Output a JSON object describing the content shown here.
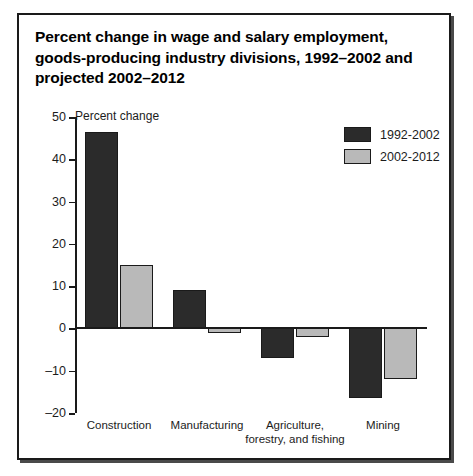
{
  "figure": {
    "title": "Percent change in wage and salary employment, goods-producing industry divisions, 1992–2002 and projected 2002–2012"
  },
  "chart_data": {
    "type": "bar",
    "title": "Percent change in wage and salary employment, goods-producing industry divisions, 1992–2002 and projected 2002–2012",
    "xlabel": "",
    "ylabel": "Percent change",
    "ylim": [
      -20,
      50
    ],
    "yticks": [
      50,
      40,
      30,
      20,
      10,
      0,
      -10,
      -20
    ],
    "ytick_labels": [
      "50",
      "40",
      "30",
      "20",
      "10",
      "0",
      "–10",
      "–20"
    ],
    "grid": false,
    "legend_position": "top-right",
    "categories": [
      "Construction",
      "Manufacturing",
      "Agriculture, forestry, and fishing",
      "Mining"
    ],
    "category_lines": [
      [
        "Construction"
      ],
      [
        "Manufacturing"
      ],
      [
        "Agriculture,",
        "forestry, and fishing"
      ],
      [
        "Mining"
      ]
    ],
    "series": [
      {
        "name": "1992-2002",
        "color": "#2b2b2b",
        "values": [
          46.5,
          9.0,
          -7.0,
          -16.5
        ]
      },
      {
        "name": "2002-2012",
        "color": "#b9b9b9",
        "values": [
          15.0,
          -1.0,
          -2.0,
          -12.0
        ]
      }
    ]
  },
  "legend": {
    "items": [
      {
        "label": "1992-2002",
        "swatch": "dark"
      },
      {
        "label": "2002-2012",
        "swatch": "light"
      }
    ]
  }
}
